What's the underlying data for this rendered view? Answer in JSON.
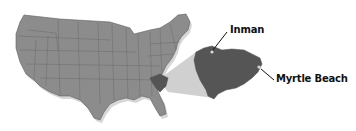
{
  "figure": {
    "colors": {
      "us_fill": "#8c8c8c",
      "us_border": "#5e5e5e",
      "us_shadow": "#cfcfcf",
      "sc_fill": "#555555",
      "zoom_wedge": "#c8c8c8",
      "label_text": "#111111",
      "leader_line": "#111111",
      "city_marker": "#d8d8d8"
    },
    "highlighted_state": "South Carolina",
    "labels": {
      "city_1": "Inman",
      "city_2": "Myrtle Beach"
    }
  }
}
